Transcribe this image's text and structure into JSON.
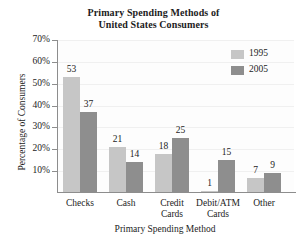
{
  "chart_data": {
    "type": "bar",
    "title": "Primary Spending Methods of United States Consumers",
    "title_lines": [
      "Primary Spending Methods of",
      "United States Consumers"
    ],
    "xlabel": "Primary Spending Method",
    "ylabel": "Percentage of Consumers",
    "categories": [
      "Checks",
      "Cash",
      "Credit Cards",
      "Debit/ATM Cards",
      "Other"
    ],
    "category_lines": [
      [
        "Checks"
      ],
      [
        "Cash"
      ],
      [
        "Credit",
        "Cards"
      ],
      [
        "Debit/ATM",
        "Cards"
      ],
      [
        "Other"
      ]
    ],
    "series": [
      {
        "name": "1995",
        "color": "#c6c6c6",
        "values": [
          53,
          21,
          18,
          1,
          7
        ]
      },
      {
        "name": "2005",
        "color": "#8e8e8e",
        "values": [
          37,
          14,
          25,
          15,
          9
        ]
      }
    ],
    "ylim": [
      0,
      70
    ],
    "ytick_values": [
      70,
      60,
      50,
      40,
      30,
      20,
      10
    ],
    "ytick_labels": [
      "70%",
      "60%",
      "50%",
      "40%",
      "30%",
      "20%",
      "10%"
    ],
    "grid": true,
    "grid_axis": "y",
    "legend_position": "top-right",
    "value_labels": true
  },
  "legend": {
    "entries": [
      {
        "label": "1995"
      },
      {
        "label": "2005"
      }
    ]
  }
}
